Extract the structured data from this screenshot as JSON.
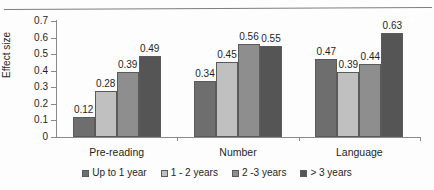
{
  "figure": {
    "has_top_rule": true,
    "background_color": "#fdfdfd"
  },
  "axes": {
    "ylabel": "Effect size",
    "ytick_labels": [
      "0",
      "0.1",
      "0.2",
      "0.3",
      "0.4",
      "0.5",
      "0.6",
      "0.7"
    ]
  },
  "chart_data": {
    "type": "bar",
    "title": "",
    "xlabel": "",
    "ylabel": "Effect size",
    "ylim": [
      0,
      0.7
    ],
    "ytick_step": 0.1,
    "grid": false,
    "legend_position": "bottom",
    "categories": [
      "Pre-reading",
      "Number",
      "Language"
    ],
    "series": [
      {
        "name": "Up to 1 year",
        "color": "#6e6e6e",
        "values": [
          0.12,
          0.34,
          0.47
        ],
        "labels": [
          "0.12",
          "0.34",
          "0.47"
        ]
      },
      {
        "name": "1 - 2 years",
        "color": "#c0c0c0",
        "values": [
          0.28,
          0.45,
          0.39
        ],
        "labels": [
          "0.28",
          "0.45",
          "0.39"
        ]
      },
      {
        "name": "2 -3 years",
        "color": "#8e8e8e",
        "values": [
          0.39,
          0.56,
          0.44
        ],
        "labels": [
          "0.39",
          "0.56",
          "0.44"
        ]
      },
      {
        "name": "> 3 years",
        "color": "#555555",
        "values": [
          0.49,
          0.55,
          0.63
        ],
        "labels": [
          "0.49",
          "0.55",
          "0.63"
        ]
      }
    ]
  }
}
